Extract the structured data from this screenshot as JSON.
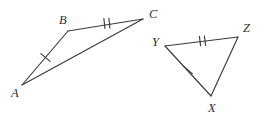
{
  "figure": {
    "background_color": "#ffffff",
    "stroke_color": "#3a3a42",
    "label_color": "#2e2e36",
    "width": 264,
    "height": 123,
    "triangles": [
      {
        "name": "triangle-abc",
        "vertices": [
          {
            "label": "A",
            "x": 22,
            "y": 85,
            "label_x": 11,
            "label_y": 97
          },
          {
            "label": "B",
            "x": 68,
            "y": 31,
            "label_x": 59,
            "label_y": 24
          },
          {
            "label": "C",
            "x": 143,
            "y": 19,
            "label_x": 149,
            "label_y": 18
          }
        ],
        "edges": [
          {
            "name": "edge-ab",
            "from": "A",
            "to": "B",
            "ticks": 1
          },
          {
            "name": "edge-bc",
            "from": "B",
            "to": "C",
            "ticks": 2
          },
          {
            "name": "edge-ac",
            "from": "A",
            "to": "C",
            "ticks": 0
          }
        ]
      },
      {
        "name": "triangle-xyz",
        "vertices": [
          {
            "label": "Y",
            "x": 165,
            "y": 46,
            "label_x": 152,
            "label_y": 46
          },
          {
            "label": "Z",
            "x": 238,
            "y": 37,
            "label_x": 243,
            "label_y": 32
          },
          {
            "label": "X",
            "x": 211,
            "y": 96,
            "label_x": 208,
            "label_y": 112
          }
        ],
        "edges": [
          {
            "name": "edge-yz",
            "from": "Y",
            "to": "Z",
            "ticks": 2
          },
          {
            "name": "edge-yx",
            "from": "Y",
            "to": "X",
            "ticks": 1
          },
          {
            "name": "edge-xz",
            "from": "X",
            "to": "Z",
            "ticks": 0
          }
        ]
      }
    ],
    "tick_marks": [
      {
        "name": "tick-ab-single",
        "edge": "edge-ab",
        "count": 1,
        "cx": 45.5,
        "cy": 57.5,
        "angle_deg": 310
      },
      {
        "name": "tick-bc-double",
        "edge": "edge-bc",
        "count": 2,
        "cx": 107,
        "cy": 23.5,
        "angle_deg": 95
      },
      {
        "name": "tick-yz-double",
        "edge": "edge-yz",
        "count": 2,
        "cx": 202,
        "cy": 41,
        "angle_deg": 83
      },
      {
        "name": "tick-yx-single",
        "edge": "edge-yx",
        "count": 1,
        "cx": 188,
        "cy": 70,
        "angle_deg": 324
      }
    ]
  }
}
